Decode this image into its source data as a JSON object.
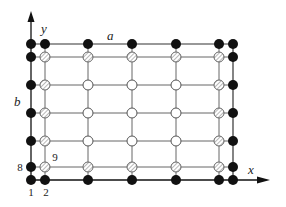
{
  "diagram": {
    "type": "grid-node-layout",
    "axes": {
      "x_label": "x",
      "y_label": "y"
    },
    "dimension_labels": {
      "width": "a",
      "height": "b"
    },
    "node_labels": [
      {
        "text": "1",
        "x": 31,
        "y": 196
      },
      {
        "text": "2",
        "x": 46,
        "y": 196
      },
      {
        "text": "8",
        "x": 20,
        "y": 171
      },
      {
        "text": "9",
        "x": 55,
        "y": 161
      }
    ],
    "columns": [
      31,
      45,
      88,
      132,
      176,
      219,
      233
    ],
    "rows": [
      44,
      57,
      85,
      113,
      141,
      167,
      180
    ],
    "legend_of_node_types": {
      "filled": "boundary node (black)",
      "hatched": "near-boundary node (hatched)",
      "open": "interior node (white)"
    },
    "node_grid": [
      [
        "filled",
        "filled",
        "filled",
        "filled",
        "filled",
        "filled",
        "filled"
      ],
      [
        "filled",
        "hatched",
        "hatched",
        "hatched",
        "hatched",
        "hatched",
        "filled"
      ],
      [
        "filled",
        "hatched",
        "open",
        "open",
        "open",
        "hatched",
        "filled"
      ],
      [
        "filled",
        "hatched",
        "open",
        "open",
        "open",
        "hatched",
        "filled"
      ],
      [
        "filled",
        "hatched",
        "open",
        "open",
        "open",
        "hatched",
        "filled"
      ],
      [
        "filled",
        "hatched",
        "hatched",
        "hatched",
        "hatched",
        "hatched",
        "filled"
      ],
      [
        "filled",
        "filled",
        "filled",
        "filled",
        "filled",
        "filled",
        "filled"
      ]
    ],
    "colors": {
      "line": "#555555",
      "axis": "#111111",
      "filled_node": "#111111",
      "open_node": "#ffffff",
      "hatched_stroke": "#777777"
    }
  }
}
